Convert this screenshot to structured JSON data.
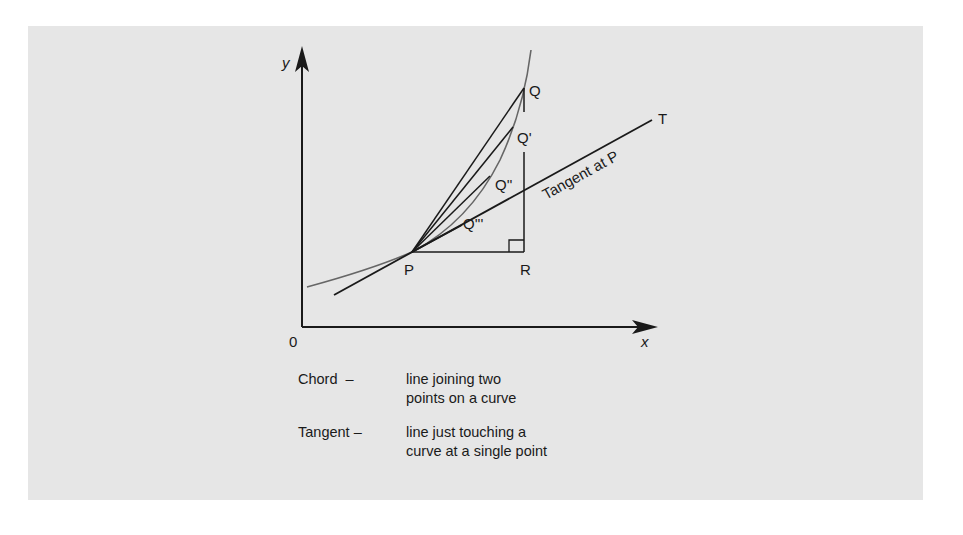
{
  "diagram": {
    "type": "chord-tangent-geometry",
    "colors": {
      "background": "#e6e6e6",
      "lines": "#1a1a1a",
      "curve": "#666666"
    },
    "axes": {
      "y_label": "y",
      "x_label": "x",
      "origin_label": "0"
    },
    "points": {
      "P": "P",
      "Q": "Q",
      "Q1": "Q'",
      "Q2": "Q''",
      "Q3": "Q'''",
      "R": "R",
      "T": "T"
    },
    "tangent_label": "Tangent at P"
  },
  "legend": {
    "items": [
      {
        "term": "Chord  –",
        "definition_lines": [
          "line joining two",
          "points on a curve"
        ]
      },
      {
        "term": "Tangent –",
        "definition_lines": [
          "line just touching a",
          "curve at a single point"
        ]
      }
    ]
  }
}
